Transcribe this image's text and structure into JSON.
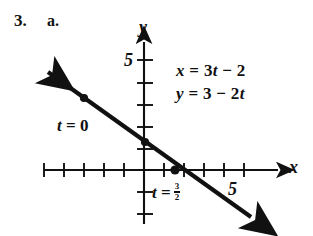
{
  "problem": {
    "number": "3.",
    "part": "a."
  },
  "equations": {
    "x_equation": "x = 3t − 2",
    "y_equation": "y = 3 − 2t"
  },
  "annotations": {
    "t_zero": "t = 0",
    "t_three_halves_prefix": "t =",
    "t_three_halves_numerator": "3",
    "t_three_halves_denominator": "2"
  },
  "axes": {
    "x_label": "x",
    "y_label": "y",
    "x_tick_label": "5",
    "y_tick_label": "5"
  },
  "colors": {
    "ink": "#111111",
    "background": "#ffffff"
  },
  "chart_data": {
    "type": "line",
    "title": "",
    "xlabel": "x",
    "ylabel": "y",
    "xlim": [
      -5,
      7
    ],
    "ylim": [
      -2.5,
      5.8
    ],
    "grid": false,
    "legend": "none",
    "parametric": {
      "x_of_t": "x = 3t - 2",
      "y_of_t": "y = 3 - 2t",
      "cartesian_form": "y = (5 - 2x)/3",
      "slope": -0.6667,
      "y_intercept": 1.6667,
      "x_intercept": 2.5
    },
    "series": [
      {
        "name": "parametric line",
        "style": "solid double-arrow",
        "x": [
          -5,
          7
        ],
        "y": [
          5,
          -3
        ]
      }
    ],
    "points": [
      {
        "label": "t = 0",
        "t": 0,
        "x": -2,
        "y": 3,
        "marker": "filled-dot"
      },
      {
        "label": "",
        "t": 1,
        "x": 1,
        "y": 1,
        "marker": "filled-dot"
      },
      {
        "label": "t = 3/2",
        "t": 1.5,
        "x": 2.5,
        "y": 0,
        "marker": "filled-dot"
      }
    ],
    "x_ticks": [
      -5,
      -4,
      -3,
      -2,
      -1,
      1,
      2,
      3,
      4,
      5,
      6
    ],
    "y_ticks": [
      -2,
      -1,
      1,
      2,
      3,
      4,
      5
    ],
    "labeled_x_ticks": [
      5
    ],
    "labeled_y_ticks": [
      5
    ]
  }
}
